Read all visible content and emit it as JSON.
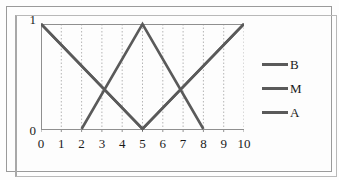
{
  "chart_data": {
    "type": "line",
    "title": "",
    "xlabel": "",
    "ylabel": "",
    "xlim": [
      0,
      10
    ],
    "ylim": [
      0,
      1
    ],
    "grid": true,
    "grid_axis": "x",
    "grid_style": "dotted",
    "legend_position": "right",
    "x_ticks": [
      "0",
      "1",
      "2",
      "3",
      "4",
      "5",
      "6",
      "7",
      "8",
      "9",
      "10"
    ],
    "y_ticks": [
      "0",
      "1"
    ],
    "line_color": "#5a5a5a",
    "series": [
      {
        "name": "B",
        "points": [
          [
            0,
            1
          ],
          [
            5,
            0
          ],
          [
            10,
            1
          ]
        ]
      },
      {
        "name": "M",
        "points": [
          [
            2,
            0
          ],
          [
            5,
            1
          ],
          [
            8,
            0
          ]
        ]
      },
      {
        "name": "A",
        "points": [
          [
            0,
            1
          ],
          [
            5,
            0
          ],
          [
            10,
            1
          ]
        ]
      }
    ]
  },
  "legend": {
    "entries": [
      {
        "label": "B",
        "color": "#5a5a5a"
      },
      {
        "label": "M",
        "color": "#5a5a5a"
      },
      {
        "label": "A",
        "color": "#5a5a5a"
      }
    ]
  },
  "axes": {
    "y_top_label": "1",
    "y_bottom_label": "0"
  }
}
